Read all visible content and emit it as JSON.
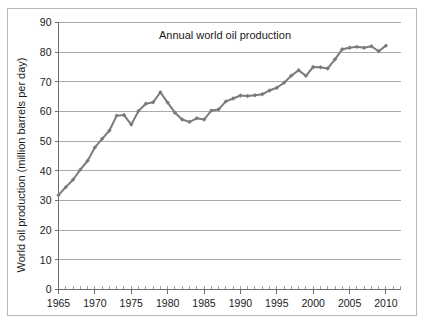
{
  "chart_data": {
    "type": "line",
    "title": "Annual world oil production",
    "xlabel": "",
    "ylabel": "World oil production (million barrels per day)",
    "xlim": [
      1965,
      2012
    ],
    "ylim": [
      0,
      90
    ],
    "ytick_step": 10,
    "xtick_step": 5,
    "x_minor_tick_step": 1,
    "grid": "horizontal",
    "legend": "none",
    "series_color": "#7b7b7b",
    "marker": "diamond",
    "yticks": [
      0,
      10,
      20,
      30,
      40,
      50,
      60,
      70,
      80,
      90
    ],
    "ytick_labels": [
      "0",
      "10",
      "20",
      "30",
      "40",
      "50",
      "60",
      "70",
      "80",
      "90"
    ],
    "xticks": [
      1965,
      1970,
      1975,
      1980,
      1985,
      1990,
      1995,
      2000,
      2005,
      2010
    ],
    "xtick_labels": [
      "1965",
      "1970",
      "1975",
      "1980",
      "1985",
      "1990",
      "1995",
      "2000",
      "2005",
      "2010"
    ],
    "x": [
      1965,
      1966,
      1967,
      1968,
      1969,
      1970,
      1971,
      1972,
      1973,
      1974,
      1975,
      1976,
      1977,
      1978,
      1979,
      1980,
      1981,
      1982,
      1983,
      1984,
      1985,
      1986,
      1987,
      1988,
      1989,
      1990,
      1991,
      1992,
      1993,
      1994,
      1995,
      1996,
      1997,
      1998,
      1999,
      2000,
      2001,
      2002,
      2003,
      2004,
      2005,
      2006,
      2007,
      2008,
      2009,
      2010
    ],
    "values": [
      31.8,
      34.5,
      37.0,
      40.4,
      43.4,
      47.9,
      50.8,
      53.6,
      58.6,
      58.8,
      55.6,
      60.2,
      62.6,
      63.1,
      66.5,
      63.0,
      59.6,
      57.3,
      56.5,
      57.7,
      57.3,
      60.3,
      60.7,
      63.4,
      64.4,
      65.4,
      65.2,
      65.5,
      65.8,
      67.1,
      68.0,
      69.7,
      72.1,
      73.9,
      72.0,
      75.0,
      74.9,
      74.5,
      77.6,
      81.0,
      81.5,
      81.8,
      81.5,
      82.0,
      80.3,
      82.2
    ]
  }
}
